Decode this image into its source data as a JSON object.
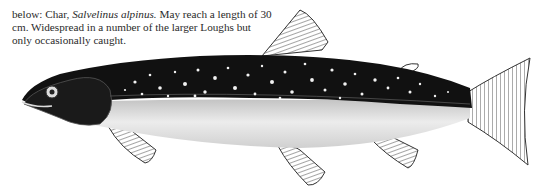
{
  "caption": {
    "prefix": "below: Char, ",
    "species": "Salvelinus alpinus.",
    "rest": " May reach a length of 30 cm. Widespread in a number of the larger Loughs but only occasionally caught."
  },
  "illustration": {
    "subject": "Char (Salvelinus alpinus)",
    "colors": {
      "dark": "#111111",
      "belly": "#e6e6e6",
      "spots": "#f2f2f2",
      "fin": "#9a9a9a"
    }
  }
}
